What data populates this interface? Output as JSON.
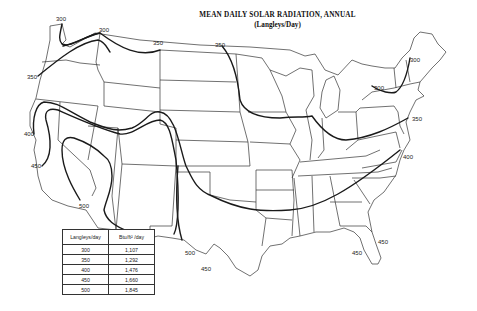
{
  "map": {
    "title": "MEAN DAILY SOLAR RADIATION, ANNUAL",
    "subtitle": "(Langleys/Day)",
    "region": "Contiguous United States",
    "colors": {
      "lines": "#222222",
      "background": "#ffffff"
    },
    "isoline_labels": [
      {
        "id": "wa-300",
        "text": "300"
      },
      {
        "id": "id-300",
        "text": "300"
      },
      {
        "id": "mt-350",
        "text": "350"
      },
      {
        "id": "nd-350",
        "text": "350"
      },
      {
        "id": "or-350",
        "text": "350"
      },
      {
        "id": "ca-400",
        "text": "400"
      },
      {
        "id": "ca-450",
        "text": "450"
      },
      {
        "id": "az-500",
        "text": "500"
      },
      {
        "id": "tx-500",
        "text": "500"
      },
      {
        "id": "tx-450",
        "text": "450"
      },
      {
        "id": "ny-300",
        "text": "300"
      },
      {
        "id": "vt-300",
        "text": "300"
      },
      {
        "id": "nj-350",
        "text": "350"
      },
      {
        "id": "va-400",
        "text": "400"
      },
      {
        "id": "fl-450-east",
        "text": "450"
      },
      {
        "id": "fl-450-west",
        "text": "450"
      }
    ]
  },
  "legend": {
    "headers": [
      "Langleys/day",
      "Btu/ft² /day"
    ],
    "rows": [
      [
        "300",
        "1,107"
      ],
      [
        "350",
        "1,292"
      ],
      [
        "400",
        "1,476"
      ],
      [
        "450",
        "1,660"
      ],
      [
        "500",
        "1,845"
      ]
    ]
  }
}
